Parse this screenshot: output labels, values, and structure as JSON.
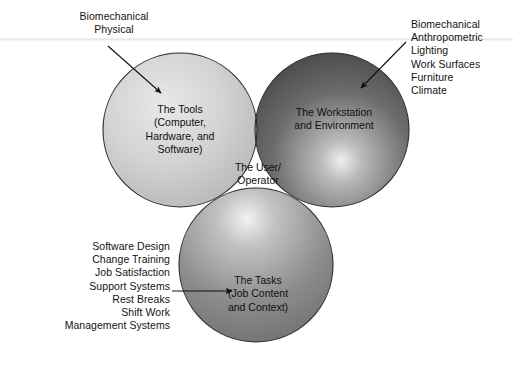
{
  "figure": {
    "type": "venn-diagram",
    "set_count": 3,
    "background_color": "#ffffff",
    "text_color": "#131313"
  },
  "circles": {
    "tools": {
      "label": "The Tools\n(Computer,\nHardware, and\nSoftware)",
      "fill_light": "#dedede",
      "fill_dark": "#a8a8a8",
      "center_x": 180,
      "center_y": 130,
      "radius": 77
    },
    "workstation": {
      "label": "The Workstation\nand Environment",
      "fill_light": "#d6d6d6",
      "fill_dark": "#474747",
      "center_x": 332,
      "center_y": 130,
      "radius": 77
    },
    "tasks": {
      "label": "The Tasks\n(Job Content\nand Context)",
      "fill_light": "#e8e8e8",
      "fill_dark": "#6e6e6e",
      "center_x": 256,
      "center_y": 265,
      "radius": 77
    }
  },
  "intersection": {
    "center_label": "The User/\nOperator",
    "center_fill": "#dcdcdc"
  },
  "annotations": {
    "tools_factors": {
      "text": "Biomechanical\nPhysical",
      "align": "center",
      "arrow_from": [
        108,
        46
      ],
      "arrow_to": [
        161,
        93
      ]
    },
    "workstation_factors": {
      "text": "Biomechanical\nAnthropometric\nLighting\nWork Surfaces\nFurniture\nClimate",
      "align": "left",
      "arrow_from": [
        406,
        42
      ],
      "arrow_to": [
        361,
        88
      ]
    },
    "tasks_factors": {
      "text": "Software Design\nChange Training\nJob Satisfaction\nSupport Systems\nRest Breaks\nShift Work\nManagement Systems",
      "align": "right",
      "arrow_from": [
        172,
        291
      ],
      "arrow_to": [
        232,
        291
      ]
    }
  }
}
